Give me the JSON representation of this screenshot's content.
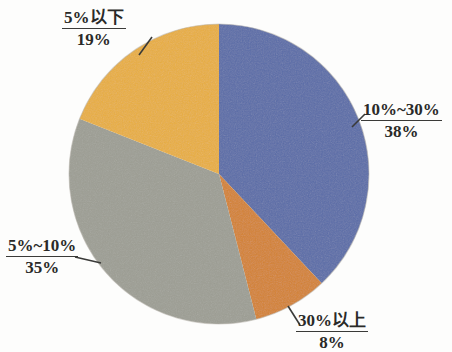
{
  "chart_data": {
    "type": "pie",
    "title": "",
    "subtitle": "",
    "xlabel": "",
    "ylabel": "",
    "legend_position": "none",
    "grid": false,
    "unit": "%",
    "categories": [
      "10%~30%",
      "30%以上",
      "5%~10%",
      "5%以下"
    ],
    "values": [
      38,
      8,
      35,
      19
    ],
    "colors": [
      "#5a6ca8",
      "#d4822f",
      "#9d9e94",
      "#e9ae3e"
    ],
    "start_angle_deg": 0,
    "direction": "clockwise",
    "slices": [
      {
        "label": "10%~30%",
        "value": 38,
        "value_text": "38%",
        "color": "#5a6ca8"
      },
      {
        "label": "30%以上",
        "value": 8,
        "value_text": "8%",
        "color": "#d4822f"
      },
      {
        "label": "5%~10%",
        "value": 35,
        "value_text": "35%",
        "color": "#9d9e94"
      },
      {
        "label": "5%以下",
        "value": 19,
        "value_text": "19%",
        "color": "#e9ae3e"
      }
    ]
  },
  "callouts": {
    "right": {
      "category": "10%~30%",
      "value": "38%"
    },
    "bottom": {
      "category": "30%以上",
      "value": "8%"
    },
    "left": {
      "category": "5%~10%",
      "value": "35%"
    },
    "top": {
      "category": "5%以下",
      "value": "19%"
    }
  },
  "style": {
    "background": "#fdfdfc",
    "text_color": "#2a2a28",
    "leader_color": "#3a3a38",
    "blue": "#5a6ca8",
    "orange": "#d4822f",
    "gray": "#9d9e94",
    "gold": "#e9ae3e"
  }
}
